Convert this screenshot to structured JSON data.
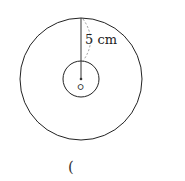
{
  "figure": {
    "outer_circle": {
      "cx": 81,
      "cy": 79,
      "r": 61
    },
    "inner_circle": {
      "cx": 81,
      "cy": 79,
      "r": 18
    },
    "center_label": "ㅇ",
    "measure_label": "5 cm",
    "answer_blank": "("
  }
}
